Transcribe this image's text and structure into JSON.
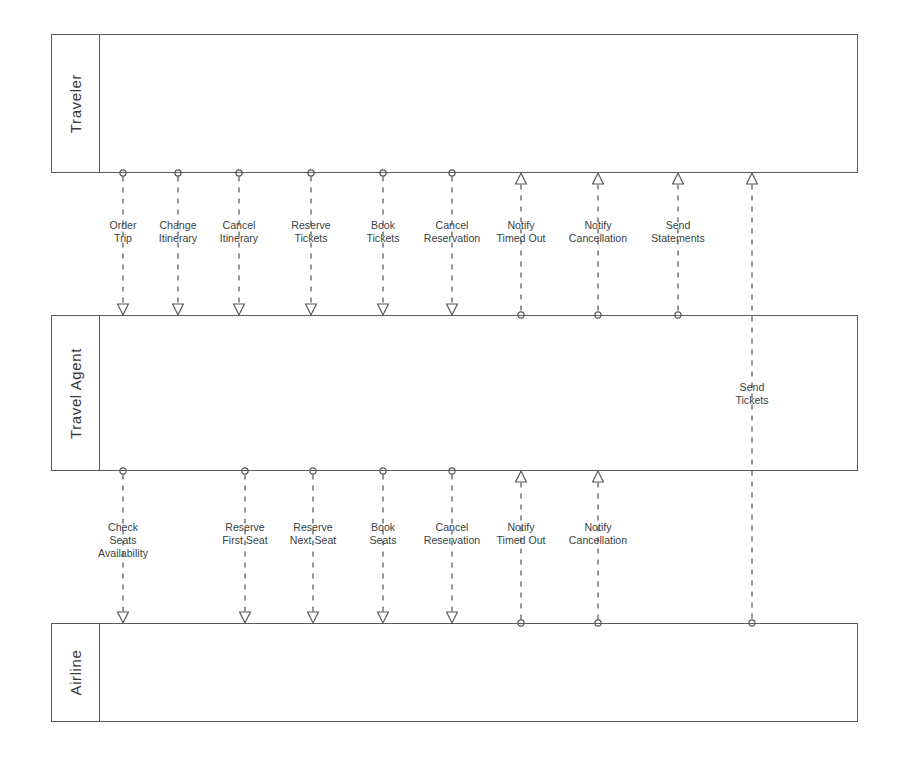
{
  "diagram": {
    "stroke_color": "#555b5e",
    "text_color": "#3a3f42",
    "background": "#ffffff",
    "lanes": [
      {
        "id": "traveler",
        "label": "Traveler",
        "top": 34,
        "bottom": 173
      },
      {
        "id": "travelagent",
        "label": "Travel Agent",
        "top": 315,
        "bottom": 471
      },
      {
        "id": "airline",
        "label": "Airline",
        "top": 623,
        "bottom": 722
      }
    ],
    "lane_geometry": {
      "left": 51,
      "right": 858,
      "header_width": 48
    },
    "groups": [
      {
        "id": "traveler-travelagent",
        "from_lane": "traveler",
        "to_lane": "travelagent",
        "label_y": 219,
        "messages": [
          {
            "id": "order-trip",
            "label": "Order\nTrip",
            "x": 123,
            "direction": "down"
          },
          {
            "id": "change-itinerary",
            "label": "Change\nItinerary",
            "x": 178,
            "direction": "down"
          },
          {
            "id": "cancel-itinerary",
            "label": "Cancel\nItinerary",
            "x": 239,
            "direction": "down"
          },
          {
            "id": "reserve-tickets",
            "label": "Reserve\nTickets",
            "x": 311,
            "direction": "down"
          },
          {
            "id": "book-tickets",
            "label": "Book\nTickets",
            "x": 383,
            "direction": "down"
          },
          {
            "id": "cancel-reservation",
            "label": "Cancel\nReservation",
            "x": 452,
            "direction": "down"
          },
          {
            "id": "notify-timed-out",
            "label": "Notify\nTimed Out",
            "x": 521,
            "direction": "up"
          },
          {
            "id": "notify-cancellation",
            "label": "Notify\nCancellation",
            "x": 598,
            "direction": "up"
          },
          {
            "id": "send-statements",
            "label": "Send\nStatements",
            "x": 678,
            "direction": "up"
          }
        ]
      },
      {
        "id": "travelagent-airline",
        "from_lane": "travelagent",
        "to_lane": "airline",
        "label_y": 521,
        "messages": [
          {
            "id": "check-seats-availability",
            "label": "Check\nSeats\nAvailability",
            "x": 123,
            "direction": "down"
          },
          {
            "id": "reserve-first-seat",
            "label": "Reserve\nFirst Seat",
            "x": 245,
            "direction": "down"
          },
          {
            "id": "reserve-next-seat",
            "label": "Reserve\nNext Seat",
            "x": 313,
            "direction": "down"
          },
          {
            "id": "book-seats",
            "label": "Book\nSeats",
            "x": 383,
            "direction": "down"
          },
          {
            "id": "cancel-reservation-air",
            "label": "Cancel\nReservation",
            "x": 452,
            "direction": "down"
          },
          {
            "id": "notify-timed-out-air",
            "label": "Notify\nTimed Out",
            "x": 521,
            "direction": "up"
          },
          {
            "id": "notify-cancellation-air",
            "label": "Notify\nCancellation",
            "x": 598,
            "direction": "up"
          }
        ]
      }
    ],
    "long_messages": [
      {
        "id": "send-tickets",
        "label": "Send\nTickets",
        "x": 752,
        "direction": "up",
        "from_lane": "airline",
        "to_lane": "traveler",
        "label_y": 381
      }
    ]
  }
}
